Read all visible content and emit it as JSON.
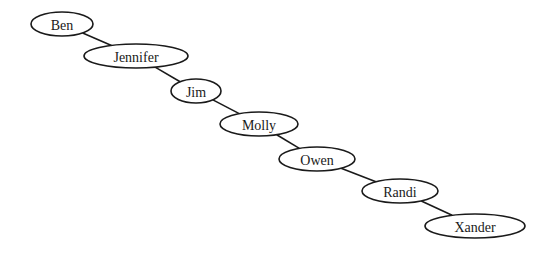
{
  "diagram": {
    "type": "tree",
    "nodes": [
      {
        "id": "ben",
        "label": "Ben",
        "cx": 62,
        "cy": 24,
        "rx": 31,
        "ry": 12
      },
      {
        "id": "jennifer",
        "label": "Jennifer",
        "cx": 136,
        "cy": 56,
        "rx": 52,
        "ry": 12
      },
      {
        "id": "jim",
        "label": "Jim",
        "cx": 196,
        "cy": 91,
        "rx": 25,
        "ry": 12
      },
      {
        "id": "molly",
        "label": "Molly",
        "cx": 259,
        "cy": 124,
        "rx": 39,
        "ry": 12
      },
      {
        "id": "owen",
        "label": "Owen",
        "cx": 317,
        "cy": 159,
        "rx": 38,
        "ry": 12
      },
      {
        "id": "randi",
        "label": "Randi",
        "cx": 400,
        "cy": 191,
        "rx": 38,
        "ry": 12
      },
      {
        "id": "xander",
        "label": "Xander",
        "cx": 475,
        "cy": 226,
        "rx": 50,
        "ry": 12
      }
    ],
    "edges": [
      {
        "from": "ben",
        "to": "jennifer"
      },
      {
        "from": "jennifer",
        "to": "jim"
      },
      {
        "from": "jim",
        "to": "molly"
      },
      {
        "from": "molly",
        "to": "owen"
      },
      {
        "from": "owen",
        "to": "randi"
      },
      {
        "from": "randi",
        "to": "xander"
      }
    ],
    "colors": {
      "stroke": "#1a1a1a",
      "fill": "#ffffff",
      "background": "#ffffff"
    }
  }
}
